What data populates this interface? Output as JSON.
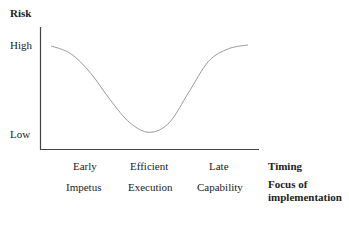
{
  "chart_data": {
    "type": "line",
    "title": "",
    "ylabel": "Risk",
    "y_ticks": [
      "High",
      "Low"
    ],
    "x_rows": [
      {
        "label": "Timing",
        "categories": [
          "Early",
          "Efficient",
          "Late"
        ]
      },
      {
        "label": "Focus of implementation",
        "label_lines": [
          "Focus of",
          "implementation"
        ],
        "categories": [
          "Impetus",
          "Execution",
          "Capability"
        ]
      }
    ],
    "series": [
      {
        "name": "Risk curve",
        "shape": "U-shaped",
        "x": [
          0,
          0.1,
          0.2,
          0.3,
          0.4,
          0.5,
          0.6,
          0.7,
          0.8,
          0.9,
          1.0
        ],
        "y": [
          0.98,
          0.9,
          0.7,
          0.42,
          0.18,
          0.08,
          0.18,
          0.5,
          0.82,
          0.95,
          0.99
        ]
      }
    ],
    "xlim": [
      0,
      1
    ],
    "ylim": [
      0,
      1
    ],
    "grid": false,
    "legend": "none",
    "colors": {
      "axis": "#444444",
      "curve": "#9a9a9a"
    }
  }
}
